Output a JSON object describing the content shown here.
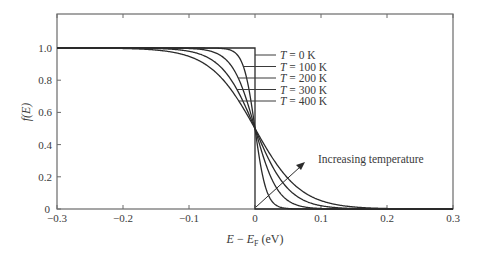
{
  "chart_data": {
    "type": "line",
    "title": "",
    "xlabel": "E − E_F (eV)",
    "xlabel_parts": {
      "E": "E",
      "minus": " − ",
      "EF": "E",
      "F_sub": "F",
      "unit": " (eV)"
    },
    "ylabel": "f(E)",
    "xlim": [
      -0.3,
      0.3
    ],
    "ylim": [
      0,
      1.2
    ],
    "grid": false,
    "x_ticks": [
      -0.3,
      -0.2,
      -0.1,
      0,
      0.1,
      0.2,
      0.3
    ],
    "x_tick_labels": [
      "−0.3",
      "−0.2",
      "−0.1",
      "0",
      "0.1",
      "0.2",
      "0.3"
    ],
    "y_ticks": [
      0,
      0.2,
      0.4,
      0.6,
      0.8,
      1.0
    ],
    "y_tick_labels": [
      "0",
      "0.2",
      "0.4",
      "0.6",
      "0.8",
      "1.0"
    ],
    "function": "f(E) = 1 / (1 + exp((E - E_F) / (k_B T)))",
    "k_B_eV_per_K": 8.617e-05,
    "series": [
      {
        "name": "T = 0 K",
        "T": 0,
        "label_T": "T",
        "label_rest": " = 0 K"
      },
      {
        "name": "T = 100 K",
        "T": 100,
        "label_T": "T",
        "label_rest": " = 100 K"
      },
      {
        "name": "T = 200 K",
        "T": 200,
        "label_T": "T",
        "label_rest": " = 200 K"
      },
      {
        "name": "T = 300 K",
        "T": 300,
        "label_T": "T",
        "label_rest": " = 300 K"
      },
      {
        "name": "T = 400 K",
        "T": 400,
        "label_T": "T",
        "label_rest": " = 400 K"
      }
    ],
    "sample_points": {
      "x": [
        -0.1,
        -0.05,
        0,
        0.05,
        0.1
      ],
      "T_0K": [
        1,
        1,
        0.5,
        0,
        0
      ],
      "T_100K": [
        1.0,
        1.0,
        0.5,
        0.003,
        0.0
      ],
      "T_200K": [
        1.0,
        0.947,
        0.5,
        0.053,
        0.003
      ],
      "T_300K": [
        0.979,
        0.873,
        0.5,
        0.127,
        0.021
      ],
      "T_400K": [
        0.947,
        0.8,
        0.5,
        0.2,
        0.053
      ]
    },
    "legend_position": "right of curves, upper-center, with leader lines",
    "annotations": [
      {
        "text": "Increasing temperature",
        "arrow_from": [
          0.0,
          0.01
        ],
        "arrow_to": [
          0.075,
          0.28
        ]
      }
    ]
  }
}
